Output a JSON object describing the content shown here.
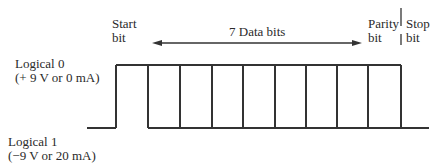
{
  "diagram": {
    "labels": {
      "start_bit_line1": "Start",
      "start_bit_line2": "bit",
      "data_bits": "7 Data bits",
      "parity_bit_line1": "Parity",
      "parity_bit_line2": "bit",
      "stop_bit_line1": "Stop",
      "stop_bit_line2": "bit",
      "logical0_line1": "Logical 0",
      "logical0_line2": "(+ 9 V or 0 mA)",
      "logical1_line1": "Logical 1",
      "logical1_line2": "(−9 V or 20 mA)"
    },
    "waveform": {
      "high_level_y": 65,
      "low_level_y": 128,
      "baseline_start_x": 87,
      "baseline_end_x": 429,
      "bit_boundaries_x": [
        116,
        148,
        180,
        212,
        243,
        275,
        306,
        337,
        368,
        401
      ],
      "bits": [
        "start",
        "d1",
        "d2",
        "d3",
        "d4",
        "d5",
        "d6",
        "d7",
        "parity"
      ]
    },
    "colors": {
      "line": "#333333",
      "text": "#2a2a2a",
      "background": "#ffffff"
    }
  }
}
